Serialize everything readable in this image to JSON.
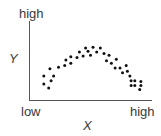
{
  "chart_data": {
    "type": "scatter",
    "title": "",
    "xlabel": "X",
    "ylabel": "Y",
    "x_tick_labels": [
      "low",
      "high"
    ],
    "y_tick_labels": [
      "high"
    ],
    "grid": false,
    "legend": null,
    "xlim": [
      0,
      1
    ],
    "ylim": [
      0,
      1
    ],
    "points": [
      [
        0.12,
        0.3
      ],
      [
        0.12,
        0.2
      ],
      [
        0.16,
        0.15
      ],
      [
        0.18,
        0.24
      ],
      [
        0.2,
        0.3
      ],
      [
        0.17,
        0.39
      ],
      [
        0.24,
        0.41
      ],
      [
        0.29,
        0.43
      ],
      [
        0.3,
        0.5
      ],
      [
        0.34,
        0.46
      ],
      [
        0.34,
        0.54
      ],
      [
        0.39,
        0.53
      ],
      [
        0.41,
        0.6
      ],
      [
        0.44,
        0.55
      ],
      [
        0.46,
        0.65
      ],
      [
        0.48,
        0.61
      ],
      [
        0.5,
        0.56
      ],
      [
        0.52,
        0.66
      ],
      [
        0.55,
        0.6
      ],
      [
        0.58,
        0.65
      ],
      [
        0.61,
        0.58
      ],
      [
        0.63,
        0.49
      ],
      [
        0.65,
        0.56
      ],
      [
        0.67,
        0.46
      ],
      [
        0.7,
        0.4
      ],
      [
        0.71,
        0.51
      ],
      [
        0.74,
        0.4
      ],
      [
        0.76,
        0.34
      ],
      [
        0.79,
        0.43
      ],
      [
        0.8,
        0.36
      ],
      [
        0.82,
        0.3
      ],
      [
        0.83,
        0.24
      ],
      [
        0.83,
        0.18
      ],
      [
        0.86,
        0.24
      ],
      [
        0.86,
        0.18
      ],
      [
        0.91,
        0.23
      ],
      [
        0.91,
        0.18
      ],
      [
        0.9,
        0.13
      ]
    ]
  },
  "labels": {
    "y_high": "high",
    "y_axis": "Y",
    "x_low": "low",
    "x_high": "high",
    "x_axis": "X"
  },
  "colors": {
    "axis": "#555555",
    "point": "#111111",
    "text": "#3a3a3a"
  }
}
